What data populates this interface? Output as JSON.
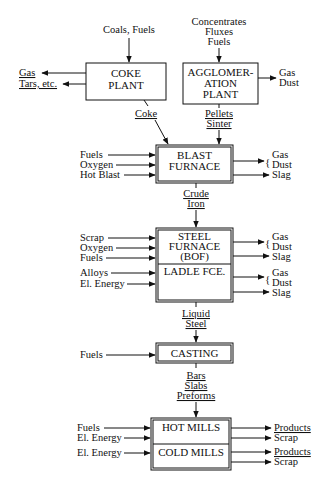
{
  "diagram": {
    "colors": {
      "ink": "#111111",
      "background": "#ffffff"
    },
    "boxes": [
      {
        "id": "coke-plant",
        "lines": [
          "COKE",
          "PLANT"
        ],
        "x": 86,
        "y": 63,
        "w": 80,
        "h": 37,
        "double": false
      },
      {
        "id": "agglomeration-plant",
        "lines": [
          "AGGLOMER-",
          "ATION",
          "PLANT"
        ],
        "x": 183,
        "y": 63,
        "w": 75,
        "h": 41,
        "double": false
      },
      {
        "id": "blast-furnace",
        "lines": [
          "BLAST",
          "FURNACE"
        ],
        "x": 156,
        "y": 145,
        "w": 77,
        "h": 38,
        "double": true
      },
      {
        "id": "steel-furnace-bof",
        "lines": [
          "STEEL",
          "FURNACE",
          "(BOF)"
        ],
        "x": 156,
        "y": 228,
        "w": 77,
        "h": 36,
        "double": true
      },
      {
        "id": "ladle-furnace",
        "lines": [
          "LADLE FCE."
        ],
        "x": 156,
        "y": 264,
        "w": 77,
        "h": 38,
        "double": true
      },
      {
        "id": "casting",
        "lines": [
          "CASTING"
        ],
        "x": 156,
        "y": 343,
        "w": 77,
        "h": 20,
        "double": true
      },
      {
        "id": "hot-mills",
        "lines": [
          "HOT MILLS"
        ],
        "x": 151,
        "y": 418,
        "w": 80,
        "h": 26,
        "double": true
      },
      {
        "id": "cold-mills",
        "lines": [
          "COLD MILLS"
        ],
        "x": 151,
        "y": 444,
        "w": 80,
        "h": 26,
        "double": true
      }
    ],
    "top_inputs": {
      "coke": {
        "lines": [
          "Coals, Fuels"
        ]
      },
      "agglomeration": {
        "lines": [
          "Concentrates",
          "Fluxes",
          "Fuels"
        ]
      }
    },
    "coke_outputs": [
      "Gas",
      "Tars, etc."
    ],
    "agglomeration_outputs": [
      "Gas",
      "Dust"
    ],
    "intermediates": {
      "coke": [
        "Coke"
      ],
      "pellets_sinter": [
        "Pellets",
        "Sinter"
      ],
      "crude_iron": [
        "Crude",
        "Iron"
      ],
      "liquid_steel": [
        "Liquid",
        "Steel"
      ],
      "semi_products": [
        "Bars",
        "Slabs",
        "Preforms"
      ]
    },
    "blast_furnace": {
      "inputs": [
        "Fuels",
        "Oxygen",
        "Hot Blast"
      ],
      "outputs_brace": [
        "Gas",
        "Dust"
      ],
      "output_slag": "Slag"
    },
    "steel_furnace": {
      "inputs": [
        "Scrap",
        "Oxygen",
        "Fuels"
      ],
      "outputs_brace": [
        "Gas",
        "Dust"
      ],
      "output_slag": "Slag"
    },
    "ladle_furnace": {
      "inputs": [
        "Alloys",
        "El. Energy"
      ],
      "outputs_brace": [
        "Gas",
        "Dust"
      ],
      "output_slag": "Slag"
    },
    "casting": {
      "inputs": [
        "Fuels"
      ]
    },
    "hot_mills": {
      "inputs": [
        "Fuels",
        "El. Energy"
      ],
      "outputs": [
        "Products",
        "Scrap"
      ]
    },
    "cold_mills": {
      "inputs": [
        "El. Energy"
      ],
      "outputs": [
        "Products",
        "Scrap"
      ]
    }
  }
}
